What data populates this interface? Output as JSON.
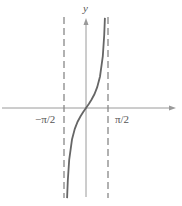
{
  "chart_data": {
    "type": "line",
    "title": "",
    "function": "y = tan(x)",
    "xlabel": "",
    "ylabel": "y",
    "x_tick_labels": [
      "−π/2",
      "π/2"
    ],
    "x_ticks": [
      -1.5708,
      1.5708
    ],
    "xlim": [
      -2.6,
      2.8
    ],
    "ylim": [
      -4.6,
      4.6
    ],
    "grid": false,
    "legend": null,
    "asymptotes": [
      {
        "x": -1.5708,
        "style": "dashed",
        "label": "−π/2"
      },
      {
        "x": 1.5708,
        "style": "dashed",
        "label": "π/2"
      }
    ],
    "series": [
      {
        "name": "tan(x)",
        "x": [
          -1.35,
          -1.3,
          -1.2,
          -1.0,
          -0.8,
          -0.6,
          -0.4,
          -0.2,
          0.0,
          0.2,
          0.4,
          0.6,
          0.8,
          1.0,
          1.2,
          1.3,
          1.35
        ],
        "values": [
          -4.46,
          -3.6,
          -2.57,
          -1.56,
          -1.03,
          -0.68,
          -0.42,
          -0.2,
          0.0,
          0.2,
          0.42,
          0.68,
          1.03,
          1.56,
          2.57,
          3.6,
          4.46
        ]
      }
    ]
  },
  "labels": {
    "y_axis": "y",
    "neg_half_pi": "−π/2",
    "pos_half_pi": "π/2"
  },
  "colors": {
    "curve": "#666666",
    "axis": "#999999",
    "asymptote": "#888888",
    "text": "#555555"
  }
}
